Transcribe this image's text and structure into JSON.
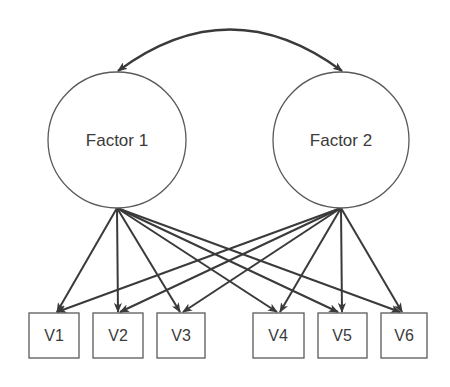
{
  "diagram": {
    "type": "confirmatory-factor-analysis",
    "colors": {
      "stroke": "#5a5a5a",
      "arrow": "#3a3a3a",
      "text": "#3a3a3a",
      "background": "#ffffff"
    },
    "factors": [
      {
        "id": "F1",
        "label": "Factor 1",
        "cx": 117,
        "cy": 140,
        "rx": 69,
        "ry": 68
      },
      {
        "id": "F2",
        "label": "Factor 2",
        "cx": 341,
        "cy": 140,
        "rx": 68,
        "ry": 68
      }
    ],
    "variables": [
      {
        "id": "V1",
        "label": "V1",
        "x": 29,
        "y": 313,
        "w": 50,
        "h": 45
      },
      {
        "id": "V2",
        "label": "V2",
        "x": 93,
        "y": 313,
        "w": 50,
        "h": 45
      },
      {
        "id": "V3",
        "label": "V3",
        "x": 157,
        "y": 313,
        "w": 48,
        "h": 45
      },
      {
        "id": "V4",
        "label": "V4",
        "x": 253,
        "y": 313,
        "w": 51,
        "h": 45
      },
      {
        "id": "V5",
        "label": "V5",
        "x": 318,
        "y": 313,
        "w": 49,
        "h": 45
      },
      {
        "id": "V6",
        "label": "V6",
        "x": 381,
        "y": 313,
        "w": 46,
        "h": 45
      }
    ],
    "covariance": {
      "from": "Factor 1",
      "to": "Factor 2",
      "bidirectional": true
    },
    "loadings": [
      {
        "from": "Factor 1",
        "to": "V1"
      },
      {
        "from": "Factor 1",
        "to": "V2"
      },
      {
        "from": "Factor 1",
        "to": "V3"
      },
      {
        "from": "Factor 1",
        "to": "V4"
      },
      {
        "from": "Factor 1",
        "to": "V5"
      },
      {
        "from": "Factor 1",
        "to": "V6"
      },
      {
        "from": "Factor 2",
        "to": "V1"
      },
      {
        "from": "Factor 2",
        "to": "V2"
      },
      {
        "from": "Factor 2",
        "to": "V3"
      },
      {
        "from": "Factor 2",
        "to": "V4"
      },
      {
        "from": "Factor 2",
        "to": "V5"
      },
      {
        "from": "Factor 2",
        "to": "V6"
      }
    ]
  }
}
